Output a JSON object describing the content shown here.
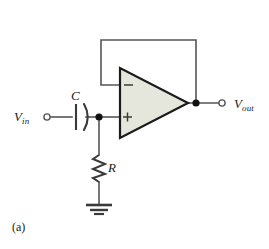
{
  "figure": {
    "caption": "(a)",
    "background_color": "#ffffff",
    "type": "schematic"
  },
  "circuit": {
    "name": "non-inverting-op-amp-high-pass-filter",
    "topology": "unity-gain buffer with series RC high-pass input network",
    "nodes": [
      {
        "name": "input-terminal",
        "label": "V",
        "subscript": "in",
        "x": 45,
        "y": 117
      },
      {
        "name": "rc-junction",
        "label": "",
        "subscript": "",
        "x": 99,
        "y": 117
      },
      {
        "name": "output-terminal",
        "label": "V",
        "subscript": "out",
        "x": 225,
        "y": 103
      },
      {
        "name": "output-junction",
        "label": "",
        "subscript": "",
        "x": 196,
        "y": 103
      }
    ],
    "components": [
      {
        "name": "capacitor-c",
        "type": "capacitor",
        "label": "C",
        "style": "electrolytic",
        "x": 81,
        "y": 117
      },
      {
        "name": "resistor-r",
        "type": "resistor",
        "label": "R",
        "style": "zigzag",
        "x": 99,
        "y": 168
      },
      {
        "name": "opamp-u1",
        "type": "operational-amplifier",
        "inverting_input": "−",
        "non_inverting_input": "+",
        "fill_color": "#e6e7dc",
        "outline_color": "#1b1b1b"
      },
      {
        "name": "ground-symbol",
        "type": "ground",
        "x": 99,
        "y": 205
      }
    ],
    "wires": [
      {
        "name": "wire-input-to-capacitor"
      },
      {
        "name": "wire-capacitor-to-junction"
      },
      {
        "name": "wire-junction-to-noninverting-input"
      },
      {
        "name": "wire-junction-to-resistor"
      },
      {
        "name": "wire-resistor-to-ground"
      },
      {
        "name": "wire-output-to-terminal"
      },
      {
        "name": "wire-feedback-loop"
      }
    ],
    "colors": {
      "wire": "#555555",
      "component": "#3a3a3a",
      "node": "#111111",
      "opamp_fill": "#e6e7dc",
      "opamp_stroke": "#1b1b1b",
      "text": "#1a1a1a"
    }
  },
  "labels": {
    "vin_main": "V",
    "vin_sub": "in",
    "vout_main": "V",
    "vout_sub": "out",
    "capacitor": "C",
    "resistor": "R",
    "caption": "(a)",
    "minus_sign": "−",
    "plus_sign": "+"
  }
}
